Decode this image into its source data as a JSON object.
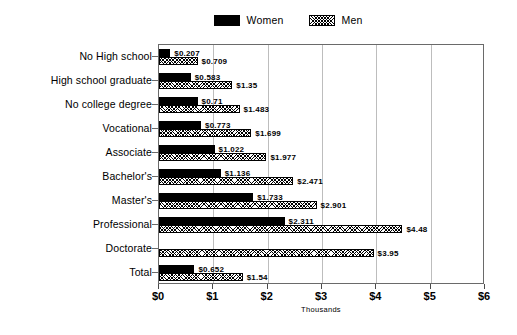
{
  "chart_data": {
    "type": "bar",
    "orientation": "horizontal",
    "title": "",
    "xlabel": "Thousands",
    "ylabel": "",
    "xlim": [
      0,
      6
    ],
    "xticks": [
      "$0",
      "$1",
      "$2",
      "$3",
      "$4",
      "$5",
      "$6"
    ],
    "xtick_values": [
      0,
      1,
      2,
      3,
      4,
      5,
      6
    ],
    "grid": true,
    "legend_position": "top-center",
    "categories": [
      "No High school",
      "High school graduate",
      "No college degree",
      "Vocational",
      "Associate",
      "Bachelor's",
      "Master's",
      "Professional",
      "Doctorate",
      "Total"
    ],
    "series": [
      {
        "name": "Women",
        "fill": "solid-black",
        "color": "#000000",
        "values": [
          0.207,
          0.583,
          0.71,
          0.773,
          1.022,
          1.136,
          1.733,
          2.311,
          null,
          0.652
        ],
        "labels": [
          "$0.207",
          "$0.583",
          "$0.71",
          "$0.773",
          "$1.022",
          "$1.136",
          "$1.733",
          "$2.311",
          "",
          "$0.652"
        ]
      },
      {
        "name": "Men",
        "fill": "hatched",
        "color": "#ffffff",
        "values": [
          0.709,
          1.35,
          1.483,
          1.699,
          1.977,
          2.471,
          2.901,
          4.48,
          3.95,
          1.54
        ],
        "labels": [
          "$0.709",
          "$1.35",
          "$1.483",
          "$1.699",
          "$1.977",
          "$2.471",
          "$2.901",
          "$4.48",
          "$3.95",
          "$1.54"
        ]
      }
    ]
  },
  "legend": {
    "entries": [
      {
        "label": "Women",
        "swatch": "solid-black-swatch"
      },
      {
        "label": "Men",
        "swatch": "hatched-swatch"
      }
    ]
  }
}
